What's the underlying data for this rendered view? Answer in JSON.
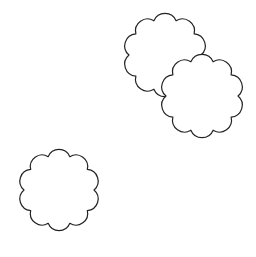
{
  "canvas": {
    "width": 256,
    "height": 257,
    "background": "#ffffff"
  },
  "style": {
    "stroke": "#222222",
    "stroke_width": 1.2,
    "fill": "#ffffff"
  },
  "shapes": [
    {
      "type": "scalloped-circle",
      "cx": 165,
      "cy": 55,
      "r": 36,
      "lobes": 10,
      "lobe_depth": 5,
      "rotation": 0
    },
    {
      "type": "scalloped-circle",
      "cx": 202,
      "cy": 96,
      "r": 36,
      "lobes": 10,
      "lobe_depth": 5,
      "rotation": 0
    },
    {
      "type": "scalloped-circle",
      "cx": 59,
      "cy": 190,
      "r": 35,
      "lobes": 10,
      "lobe_depth": 5,
      "rotation": 0
    }
  ]
}
